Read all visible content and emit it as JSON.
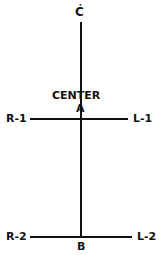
{
  "diagram": {
    "labels": {
      "top": "Ċ",
      "center_title": "CENTER",
      "center_point": "A",
      "bottom_point": "B",
      "upper_left": "R-1",
      "upper_right": "L-1",
      "lower_left": "R-2",
      "lower_right": "L-2"
    },
    "nodes": [
      {
        "id": "C",
        "label": "Ċ"
      },
      {
        "id": "A",
        "label": "A",
        "title": "CENTER"
      },
      {
        "id": "B",
        "label": "B"
      },
      {
        "id": "R-1",
        "label": "R-1"
      },
      {
        "id": "L-1",
        "label": "L-1"
      },
      {
        "id": "R-2",
        "label": "R-2"
      },
      {
        "id": "L-2",
        "label": "L-2"
      }
    ],
    "edges": [
      {
        "from": "C",
        "to": "B"
      },
      {
        "from": "R-1",
        "to": "L-1",
        "through": "A"
      },
      {
        "from": "R-2",
        "to": "L-2",
        "through": "B"
      }
    ]
  }
}
